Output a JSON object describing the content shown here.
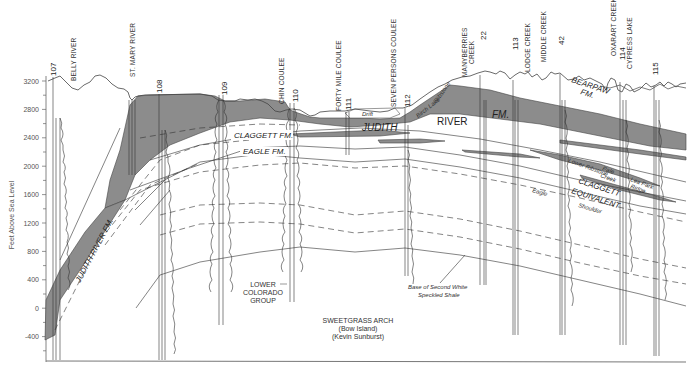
{
  "axis": {
    "title": "Feet Above Sea Level",
    "ticks": [
      "3200",
      "2800",
      "2400",
      "2000",
      "1600",
      "1200",
      "800",
      "400",
      "0",
      "-400"
    ]
  },
  "places": {
    "belly_river": "BELLY RIVER",
    "st_mary_river": "ST. MARY RIVER",
    "chin_coulee": "CHIN COULEE",
    "forty_mile_coulee": "FORTY MILE COULEE",
    "seven_persons_coulee": "SEVEN PERSONS COULEE",
    "manyberries_creek_1": "MANYBERRIES",
    "manyberries_creek_2": "CREEK",
    "lodge_creek": "LODGE CREEK",
    "middle_creek": "MIDDLE CREEK",
    "oxarart_creek": "OXARART CREEK",
    "cypress_lake": "CYPRESS LAKE"
  },
  "wells": [
    "107",
    "108",
    "109",
    "110",
    "111",
    "112",
    "22",
    "113",
    "42",
    "114",
    "115"
  ],
  "formations": {
    "judith_river_fm": "JUDITH RIVER FM.",
    "claggett_fm": "CLAGGETT FM.",
    "eagle_fm": "EAGLE FM.",
    "judith": "JUDITH",
    "river": "RIVER",
    "fm": "FM.",
    "bearpaw_1": "BEARPAW",
    "bearpaw_2": "FM.",
    "drift": "Drift",
    "birch_lake": "Birch Lake",
    "ribstone": "Ribstone",
    "lower_colorado_1": "LOWER",
    "lower_colorado_2": "COLORADO",
    "lower_colorado_3": "GROUP",
    "claggett_equiv_1": "CLAGGETT",
    "claggett_equiv_2": "EQUIVALENT",
    "eagle": "Eagle",
    "shoulder": "Shoulder",
    "lower_ribstone": "Lower Ribstone",
    "pale": "Pale",
    "creek": "Creek",
    "lea_park": "Lea Park",
    "ridge": "Ridge",
    "base_second_white_1": "Base of Second White",
    "base_second_white_2": "Speckled Shale"
  },
  "notes": {
    "arch": "SWEETGRASS ARCH",
    "bow_island": "(Bow Island)",
    "kevin_sunburst": "(Kevin Sunburst)"
  },
  "colors": {
    "shale_fill": "#8c8c8c",
    "line": "#333333",
    "axis": "#666666"
  }
}
